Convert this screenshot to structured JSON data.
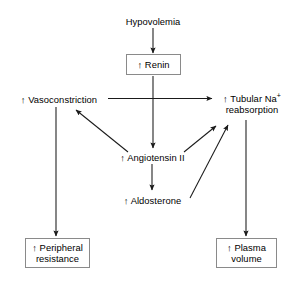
{
  "diagram": {
    "background_color": "#ffffff",
    "line_color": "#1a1a1a",
    "box_border_color": "#8a8a8a",
    "text_color": "#000000",
    "up_arrow_glyph": "↑",
    "nodes": [
      {
        "id": "hypovolemia",
        "label": "Hypovolemia",
        "line1": "Hypovolemia",
        "line2": "",
        "boxed": false,
        "arrow_prefix": ""
      },
      {
        "id": "renin",
        "label": "↑ Renin",
        "line1": "↑ Renin",
        "line2": "",
        "boxed": true,
        "arrow_prefix": "↑"
      },
      {
        "id": "vasoconstriction",
        "label": "↑ Vasoconstriction",
        "line1": "↑ Vasoconstriction",
        "line2": "",
        "boxed": false,
        "arrow_prefix": "↑"
      },
      {
        "id": "tubular-na-reabsorption",
        "label": "↑ Tubular Na+ reabsorption",
        "line1": "↑ Tubular Na",
        "line1_sup": "+",
        "line2": "reabsorption",
        "boxed": false,
        "arrow_prefix": "↑"
      },
      {
        "id": "angiotensin-ii",
        "label": "↑ Angiotensin II",
        "line1": "↑ Angiotensin II",
        "line2": "",
        "boxed": false,
        "arrow_prefix": "↑"
      },
      {
        "id": "aldosterone",
        "label": "↑ Aldosterone",
        "line1": "↑ Aldosterone",
        "line2": "",
        "boxed": false,
        "arrow_prefix": "↑"
      },
      {
        "id": "peripheral-resistance",
        "label": "↑ Peripheral resistance",
        "line1": "↑ Peripheral",
        "line2": "resistance",
        "boxed": true,
        "arrow_prefix": "↑"
      },
      {
        "id": "plasma-volume",
        "label": "↑ Plasma volume",
        "line1": "↑ Plasma",
        "line2": "volume",
        "boxed": true,
        "arrow_prefix": "↑"
      }
    ],
    "edges": [
      {
        "id": "hypovolemia-to-renin",
        "from": "hypovolemia",
        "to": "renin"
      },
      {
        "id": "renin-to-angiotensin-ii",
        "from": "renin",
        "to": "angiotensin-ii"
      },
      {
        "id": "vasoconstriction-to-tubular-na",
        "from": "vasoconstriction",
        "to": "tubular-na-reabsorption"
      },
      {
        "id": "vasoconstriction-to-peripheral-resistance",
        "from": "vasoconstriction",
        "to": "peripheral-resistance"
      },
      {
        "id": "angiotensin-ii-to-vasoconstriction",
        "from": "angiotensin-ii",
        "to": "vasoconstriction"
      },
      {
        "id": "angiotensin-ii-to-tubular-na",
        "from": "angiotensin-ii",
        "to": "tubular-na-reabsorption"
      },
      {
        "id": "angiotensin-ii-to-aldosterone",
        "from": "angiotensin-ii",
        "to": "aldosterone"
      },
      {
        "id": "aldosterone-to-tubular-na",
        "from": "aldosterone",
        "to": "tubular-na-reabsorption"
      },
      {
        "id": "tubular-na-to-plasma-volume",
        "from": "tubular-na-reabsorption",
        "to": "plasma-volume"
      }
    ]
  }
}
